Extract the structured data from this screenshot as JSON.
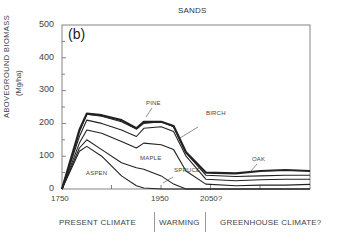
{
  "chart_data": {
    "type": "area",
    "subtype": "stacked-line",
    "title": "SANDS",
    "panel_label": "(b)",
    "xlabel": "",
    "ylabel": "ABOVEGROUND BIOMASS",
    "ylabel_units": "(Mg/ha)",
    "ylim": [
      0,
      500
    ],
    "xlim": [
      1750,
      2250
    ],
    "yticks": [
      0,
      100,
      200,
      300,
      400,
      500
    ],
    "yticks_minor_step": 50,
    "xticks": [
      1750,
      1850,
      1950,
      2050,
      2150,
      2250
    ],
    "xtick_labels": [
      "1750",
      "",
      "1950",
      "2050?",
      "",
      ""
    ],
    "grid": false,
    "x": [
      1750,
      1785,
      1800,
      1830,
      1870,
      1900,
      1915,
      1950,
      1975,
      2000,
      2040,
      2100,
      2150,
      2200,
      2250
    ],
    "series": [
      {
        "name": "ASPEN",
        "values": [
          0,
          115,
          130,
          100,
          40,
          10,
          3,
          0,
          0,
          0,
          0,
          0,
          0,
          0,
          0
        ]
      },
      {
        "name": "SPRUCE",
        "values": [
          0,
          125,
          150,
          120,
          80,
          65,
          60,
          40,
          15,
          0,
          0,
          0,
          0,
          0,
          0
        ]
      },
      {
        "name": "MAPLE",
        "values": [
          0,
          140,
          180,
          170,
          145,
          125,
          140,
          135,
          120,
          55,
          15,
          10,
          12,
          12,
          14
        ]
      },
      {
        "name": "BIRCH",
        "values": [
          0,
          160,
          210,
          200,
          180,
          160,
          185,
          190,
          175,
          100,
          30,
          25,
          28,
          30,
          30
        ]
      },
      {
        "name": "PINE",
        "values": [
          0,
          175,
          228,
          222,
          205,
          183,
          200,
          205,
          190,
          110,
          42,
          38,
          40,
          42,
          42
        ]
      },
      {
        "name": "OAK",
        "values": [
          0,
          180,
          230,
          225,
          210,
          185,
          205,
          205,
          192,
          112,
          50,
          48,
          55,
          58,
          55
        ]
      }
    ],
    "series_note": "Lines are cumulative (stacked) totals; OAK line is the top/total boundary",
    "annotations": [
      {
        "text": "PINE",
        "x": 1930,
        "y": 270
      },
      {
        "text": "BIRCH",
        "x": 2020,
        "y": 235
      },
      {
        "text": "MAPLE",
        "x": 1925,
        "y": 135
      },
      {
        "text": "ASPEN",
        "x": 1800,
        "y": 80
      },
      {
        "text": "SPRUCE",
        "x": 1985,
        "y": 75
      },
      {
        "text": "OAK",
        "x": 2150,
        "y": 85
      }
    ],
    "periods": [
      {
        "label": "PRESENT CLIMATE",
        "from": 1750,
        "to": 1950
      },
      {
        "label": "WARMING",
        "from": 1950,
        "to": 2050
      },
      {
        "label": "GREENHOUSE CLIMATE?",
        "from": 2050,
        "to": 2250
      }
    ]
  },
  "labels": {
    "title": "SANDS",
    "panel": "(b)",
    "ylabel": "ABOVEGROUND   BIOMASS",
    "ylabel_units": "(Mg/ha)",
    "yticks": [
      "0",
      "100",
      "200",
      "300",
      "400",
      "500"
    ],
    "xticks": [
      "1750",
      "1950",
      "2050?"
    ],
    "series": {
      "pine": "PINE",
      "birch": "BIRCH",
      "maple": "MAPLE",
      "aspen": "ASPEN",
      "spruce": "SPRUCE",
      "oak": "OAK"
    },
    "periods": [
      "PRESENT CLIMATE",
      "WARMING",
      "GREENHOUSE CLIMATE?"
    ]
  },
  "colors": {
    "line": "#222222",
    "axis": "#555555",
    "text": "#444444"
  }
}
